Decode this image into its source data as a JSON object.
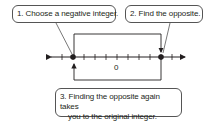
{
  "callouts": {
    "step1": "1. Choose a negative integer.",
    "step2": "2. Find the opposite.",
    "step3_line1": "3. Finding the opposite again takes",
    "step3_line2": "you to the original integer."
  },
  "number_line": {
    "zero_label": "0",
    "tick_count": 13,
    "selected_points": [
      "-4",
      "4"
    ],
    "colors": {
      "line": "#231f20",
      "point": "#231f20"
    }
  }
}
